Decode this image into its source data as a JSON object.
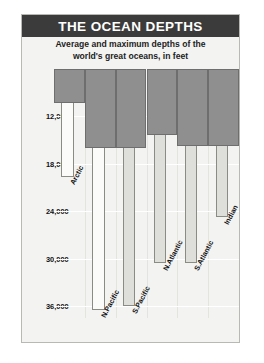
{
  "header": {
    "title": "THE OCEAN DEPTHS",
    "subtitle_line1": "Average and maximum depths of the",
    "subtitle_line2": "world's great oceans, in feet"
  },
  "colors": {
    "title_bar": "#3b3b3b",
    "title_text": "#ffffff",
    "panel_bg": "#f3f3f1",
    "average_bar": "#8f8f8f",
    "maximum_bar": "#dededa",
    "gridline": "#ffffff"
  },
  "chart_data": {
    "type": "bar",
    "title": "THE OCEAN DEPTHS",
    "subtitle": "Average and maximum depths of the world's great oceans, in feet",
    "xlabel": "",
    "ylabel": "Depth (feet)",
    "yunit": "feet",
    "ylim": [
      6000,
      37500
    ],
    "y_axis_inverted": true,
    "grid": true,
    "legend_position": "none",
    "yticks": [
      "12,000",
      "18,000",
      "24,000",
      "30,000",
      "36,000"
    ],
    "ytick_values": [
      12000,
      18000,
      24000,
      30000,
      36000
    ],
    "categories": [
      "Arctic",
      "N.Pacific",
      "S.Pacific",
      "N.Atlantic",
      "S.Atlantic",
      "Indian"
    ],
    "series": [
      {
        "name": "Average depth",
        "values": [
          3950,
          14000,
          14000,
          12250,
          13750,
          13750
        ]
      },
      {
        "name": "Maximum depth",
        "values": [
          18450,
          36200,
          35700,
          30250,
          30250,
          24450
        ]
      }
    ]
  },
  "bars": [
    {
      "label": "Arctic",
      "avg_top_px": 0,
      "avg_bottom_px": 34,
      "max_bottom_px": 108,
      "max_tone": "light"
    },
    {
      "label": "N.Pacific",
      "avg_top_px": 0,
      "avg_bottom_px": 79,
      "max_bottom_px": 241,
      "max_tone": "light"
    },
    {
      "label": "S.Pacific",
      "avg_top_px": 0,
      "avg_bottom_px": 79,
      "max_bottom_px": 237,
      "max_tone": "shade"
    },
    {
      "label": "N.Atlantic",
      "avg_top_px": 0,
      "avg_bottom_px": 66,
      "max_bottom_px": 194,
      "max_tone": "shade"
    },
    {
      "label": "S.Atlantic",
      "avg_top_px": 0,
      "avg_bottom_px": 77,
      "max_bottom_px": 194,
      "max_tone": "shade"
    },
    {
      "label": "Indian",
      "avg_top_px": 0,
      "avg_bottom_px": 77,
      "max_bottom_px": 148,
      "max_tone": "shade"
    }
  ]
}
